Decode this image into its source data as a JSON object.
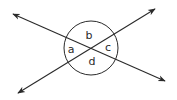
{
  "diagram": {
    "angle_labels": {
      "a": "a",
      "b": "b",
      "c": "c",
      "d": "d"
    },
    "colors": {
      "stroke": "#2a2a2a",
      "background": "#ffffff"
    }
  }
}
